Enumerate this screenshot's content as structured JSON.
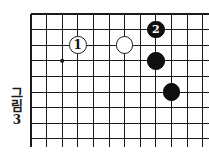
{
  "figure": {
    "caption_word": "그림",
    "caption_number": "3",
    "title": "그림 3"
  },
  "board": {
    "type": "go-board-corner-diagram",
    "line_color": "#1a1a1a",
    "border_color": "#1a1a1a",
    "background_color": "#ffffff",
    "origin_x": 31,
    "origin_y": 14,
    "cell_size": 15.6,
    "columns": 12,
    "rows": 8,
    "star_points": [
      {
        "col": 2,
        "row": 3
      }
    ]
  },
  "stones": [
    {
      "color": "white",
      "label": "1",
      "col": 3,
      "row": 2
    },
    {
      "color": "white",
      "label": "",
      "col": 6,
      "row": 2
    },
    {
      "color": "black",
      "label": "2",
      "col": 8,
      "row": 1
    },
    {
      "color": "black",
      "label": "",
      "col": 8,
      "row": 3
    },
    {
      "color": "black",
      "label": "",
      "col": 9,
      "row": 5
    }
  ],
  "colors": {
    "black_stone": "#101010",
    "white_stone": "#ffffff",
    "stone_outline": "#1a1a1a",
    "grid": "#1a1a1a",
    "text": "#1a1a1a"
  }
}
